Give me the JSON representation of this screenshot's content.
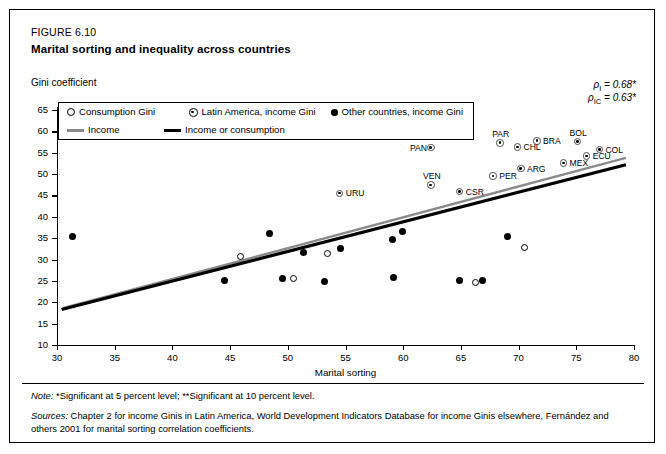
{
  "figure": {
    "number": "FIGURE 6.10",
    "title": "Marital sorting and inequality across countries"
  },
  "axis_note": {
    "y_caption": "Gini coefficient"
  },
  "annotations": {
    "rho_income": "ρ",
    "rho_income_sub": "I",
    "rho_income_val": " = 0.68*",
    "rho_ic": "ρ",
    "rho_ic_sub": "IC",
    "rho_ic_val": " = 0.63*"
  },
  "legend": {
    "items": [
      {
        "label": "Consumption Gini",
        "marker": "open-circle-icon"
      },
      {
        "label": "Latin America, income Gini",
        "marker": "half-circle-icon"
      },
      {
        "label": "Other countries, income Gini",
        "marker": "solid-circle-icon"
      },
      {
        "label": "Income",
        "marker": "grey-line-icon"
      },
      {
        "label": "Income or consumption",
        "marker": "black-line-icon"
      }
    ]
  },
  "notes": {
    "note_label": "Note:",
    "note_text": "*Significant at 5 percent level; **Significant at 10 percent level.",
    "sources_label": "Sources:",
    "sources_text": "Chapter 2 for income Ginis in Latin America, World Development Indicators Database for income Ginis elsewhere, Fernández and others 2001 for marital sorting correlation coefficients."
  },
  "chart_data": {
    "type": "scatter",
    "title": "Marital sorting and inequality across countries",
    "xlabel": "Marital sorting",
    "ylabel": "Gini coefficient",
    "xlim": [
      30,
      80
    ],
    "ylim": [
      10,
      65
    ],
    "xticks": [
      30,
      35,
      40,
      45,
      50,
      55,
      60,
      65,
      70,
      75,
      80
    ],
    "yticks": [
      10,
      15,
      20,
      25,
      30,
      35,
      40,
      45,
      50,
      55,
      60,
      65
    ],
    "grid": false,
    "legend_position": "top-left",
    "series": [
      {
        "name": "Latin America, income Gini",
        "marker": "half-circle",
        "points": [
          {
            "label": "URU",
            "x": 54.5,
            "y": 45.5,
            "label_side": "right"
          },
          {
            "label": "VEN",
            "x": 62.4,
            "y": 47.4,
            "label_side": "above"
          },
          {
            "label": "CSR",
            "x": 64.9,
            "y": 45.9,
            "label_side": "right"
          },
          {
            "label": "PAN",
            "x": 62.4,
            "y": 56.2,
            "label_side": "left"
          },
          {
            "label": "PER",
            "x": 67.8,
            "y": 49.5,
            "label_side": "right"
          },
          {
            "label": "ARG",
            "x": 70.2,
            "y": 51.3,
            "label_side": "right"
          },
          {
            "label": "PAR",
            "x": 68.4,
            "y": 57.3,
            "label_side": "above"
          },
          {
            "label": "CHL",
            "x": 69.9,
            "y": 56.3,
            "label_side": "right"
          },
          {
            "label": "MEX",
            "x": 73.9,
            "y": 52.6,
            "label_side": "right"
          },
          {
            "label": "BRA",
            "x": 71.6,
            "y": 57.8,
            "label_side": "right"
          },
          {
            "label": "BOL",
            "x": 75.1,
            "y": 57.6,
            "label_side": "above"
          },
          {
            "label": "ECU",
            "x": 75.9,
            "y": 54.2,
            "label_side": "right"
          },
          {
            "label": "COL",
            "x": 77.0,
            "y": 55.7,
            "label_side": "right"
          }
        ]
      },
      {
        "name": "Other countries, income Gini",
        "marker": "solid-circle",
        "points": [
          {
            "x": 31.3,
            "y": 35.4
          },
          {
            "x": 44.5,
            "y": 25.0
          },
          {
            "x": 48.4,
            "y": 36.0
          },
          {
            "x": 49.5,
            "y": 25.6
          },
          {
            "x": 51.4,
            "y": 31.6
          },
          {
            "x": 53.2,
            "y": 24.8
          },
          {
            "x": 54.6,
            "y": 32.6
          },
          {
            "x": 59.1,
            "y": 34.6
          },
          {
            "x": 59.2,
            "y": 25.7
          },
          {
            "x": 59.9,
            "y": 36.6
          },
          {
            "x": 64.9,
            "y": 25.1
          },
          {
            "x": 66.9,
            "y": 25.1
          },
          {
            "x": 69.0,
            "y": 35.4
          }
        ]
      },
      {
        "name": "Consumption Gini",
        "marker": "open-circle",
        "points": [
          {
            "x": 45.9,
            "y": 30.6
          },
          {
            "x": 50.5,
            "y": 25.6
          },
          {
            "x": 53.4,
            "y": 31.5
          },
          {
            "x": 66.3,
            "y": 24.6
          },
          {
            "x": 70.5,
            "y": 32.9
          }
        ]
      }
    ],
    "trend_lines": [
      {
        "name": "Income",
        "color": "#8a8a8a",
        "x1": 30.5,
        "y1": 18.6,
        "x2": 79.3,
        "y2": 53.8
      },
      {
        "name": "Income or consumption",
        "color": "#000000",
        "x1": 30.4,
        "y1": 18.3,
        "x2": 79.3,
        "y2": 52.2
      }
    ]
  }
}
